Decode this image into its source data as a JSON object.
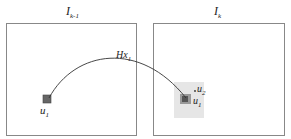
{
  "frames": [
    {
      "label": "I",
      "subscript": "k-1"
    },
    {
      "label": "I",
      "subscript": "k"
    }
  ],
  "curve_label": {
    "text": "Hx",
    "subscript": "1"
  },
  "points": {
    "left_u1": {
      "text": "u",
      "subscript": "1"
    },
    "right_u2": {
      "text": "u",
      "subscript": "2"
    },
    "right_u1": {
      "text": "u",
      "subscript": "1"
    }
  },
  "colors": {
    "frame": "#777777",
    "patch": "#e3e3e3",
    "point": "#666666",
    "curve": "#333333"
  }
}
